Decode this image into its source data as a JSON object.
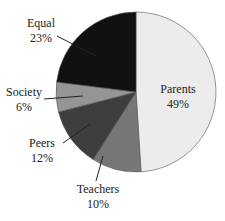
{
  "chart_data": {
    "type": "pie",
    "title": "",
    "start_angle_deg": 0,
    "direction": "clockwise",
    "center": [
      136,
      92
    ],
    "radius": 80,
    "slices": [
      {
        "name": "Parents",
        "value": 49,
        "label": "49%",
        "color": "#ececec",
        "text_color": "#333333",
        "label_pos": [
          178,
          93
        ],
        "leader": null
      },
      {
        "name": "Teachers",
        "value": 10,
        "label": "10%",
        "color": "#777777",
        "text_color": "#222222",
        "label_pos": [
          98,
          193
        ],
        "leader": [
          [
            96,
            181
          ],
          [
            103,
            156
          ]
        ]
      },
      {
        "name": "Peers",
        "value": 12,
        "label": "12%",
        "color": "#3e3e3e",
        "text_color": "#222222",
        "label_pos": [
          42,
          147
        ],
        "leader": [
          [
            63,
            143
          ],
          [
            90,
            124
          ]
        ]
      },
      {
        "name": "Society",
        "value": 6,
        "label": "6%",
        "color": "#959595",
        "text_color": "#222222",
        "label_pos": [
          24,
          96
        ],
        "leader": [
          [
            44,
            99
          ],
          [
            83,
            96
          ]
        ]
      },
      {
        "name": "Equal",
        "value": 23,
        "label": "23%",
        "color": "#111111",
        "text_color": "#222222",
        "label_pos": [
          41,
          27
        ],
        "leader": [
          [
            57,
            36
          ],
          [
            96,
            56
          ]
        ]
      }
    ],
    "legend": null
  }
}
